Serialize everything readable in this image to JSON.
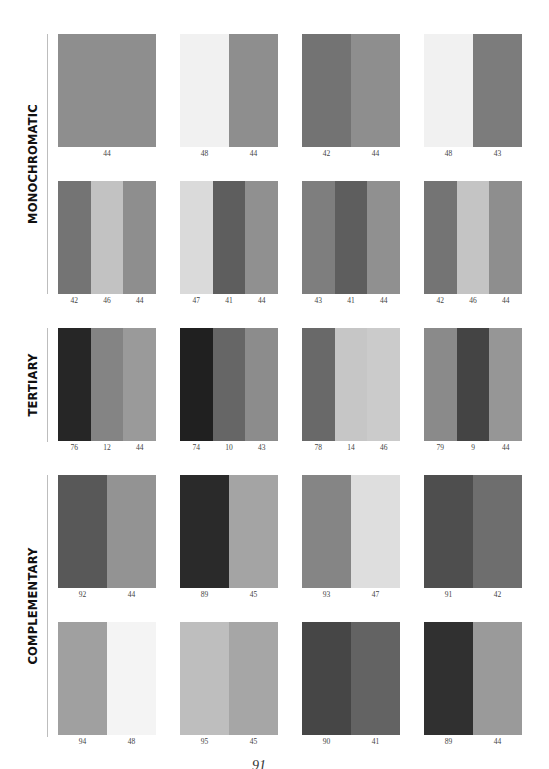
{
  "page_number": "91",
  "sections": [
    {
      "label": "MONOCHROMATIC",
      "swatches": [
        {
          "colors": [
            "#8e8e8e"
          ],
          "labels": [
            "44"
          ]
        },
        {
          "colors": [
            "#f1f1f1",
            "#8e8e8e"
          ],
          "labels": [
            "48",
            "44"
          ]
        },
        {
          "colors": [
            "#737373",
            "#8e8e8e"
          ],
          "labels": [
            "42",
            "44"
          ]
        },
        {
          "colors": [
            "#f1f1f1",
            "#7c7c7c"
          ],
          "labels": [
            "48",
            "43"
          ]
        },
        {
          "colors": [
            "#747474",
            "#c2c2c2",
            "#8e8e8e"
          ],
          "labels": [
            "42",
            "46",
            "44"
          ]
        },
        {
          "colors": [
            "#dadada",
            "#5e5e5e",
            "#909090"
          ],
          "labels": [
            "47",
            "41",
            "44"
          ]
        },
        {
          "colors": [
            "#7e7e7e",
            "#5e5e5e",
            "#909090"
          ],
          "labels": [
            "43",
            "41",
            "44"
          ]
        },
        {
          "colors": [
            "#747474",
            "#c4c4c4",
            "#8e8e8e"
          ],
          "labels": [
            "42",
            "46",
            "44"
          ]
        }
      ]
    },
    {
      "label": "TERTIARY",
      "swatches": [
        {
          "colors": [
            "#262626",
            "#848484",
            "#9a9a9a"
          ],
          "labels": [
            "76",
            "12",
            "44"
          ]
        },
        {
          "colors": [
            "#202020",
            "#666666",
            "#8c8c8c"
          ],
          "labels": [
            "74",
            "10",
            "43"
          ]
        },
        {
          "colors": [
            "#696969",
            "#c6c6c6",
            "#cbcbcb"
          ],
          "labels": [
            "78",
            "14",
            "46"
          ]
        },
        {
          "colors": [
            "#8a8a8a",
            "#444444",
            "#969696"
          ],
          "labels": [
            "79",
            "9",
            "44"
          ]
        }
      ]
    },
    {
      "label": "COMPLEMENTARY",
      "swatches": [
        {
          "colors": [
            "#585858",
            "#939393"
          ],
          "labels": [
            "92",
            "44"
          ]
        },
        {
          "colors": [
            "#2a2a2a",
            "#a4a4a4"
          ],
          "labels": [
            "89",
            "45"
          ]
        },
        {
          "colors": [
            "#858585",
            "#dedede"
          ],
          "labels": [
            "93",
            "47"
          ]
        },
        {
          "colors": [
            "#4e4e4e",
            "#6e6e6e"
          ],
          "labels": [
            "91",
            "42"
          ]
        },
        {
          "colors": [
            "#a0a0a0",
            "#f4f4f4"
          ],
          "labels": [
            "94",
            "48"
          ]
        },
        {
          "colors": [
            "#bebebe",
            "#a6a6a6"
          ],
          "labels": [
            "95",
            "45"
          ]
        },
        {
          "colors": [
            "#464646",
            "#636363"
          ],
          "labels": [
            "90",
            "41"
          ]
        },
        {
          "colors": [
            "#303030",
            "#9a9a9a"
          ],
          "labels": [
            "89",
            "44"
          ]
        }
      ]
    }
  ]
}
